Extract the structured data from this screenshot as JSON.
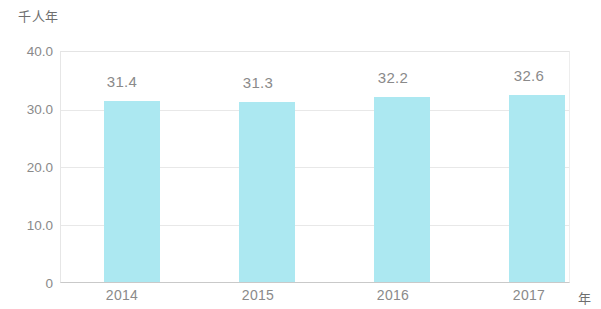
{
  "chart_data": {
    "type": "bar",
    "title": "",
    "subtitle": "",
    "xlabel": "年",
    "ylabel": "千人年",
    "categories": [
      "2014",
      "2015",
      "2016",
      "2017"
    ],
    "values": [
      31.4,
      31.3,
      32.2,
      32.6
    ],
    "value_labels": [
      "31.4",
      "31.3",
      "32.2",
      "32.6"
    ],
    "ylim": [
      0,
      40
    ],
    "yticks": [
      40,
      30,
      20,
      10,
      0
    ],
    "ytick_labels": [
      "40.0",
      "30.0",
      "20.0",
      "10.0",
      "0"
    ],
    "grid": true,
    "legend": false,
    "legend_position": "none",
    "series": [
      {
        "name": "",
        "values": [
          31.4,
          31.3,
          32.2,
          32.6
        ]
      }
    ],
    "colors": {
      "bar": "#ace8f1",
      "grid": "#e8e8e8",
      "axis": "#c9c9c9",
      "text": "#8a8a8a"
    }
  }
}
